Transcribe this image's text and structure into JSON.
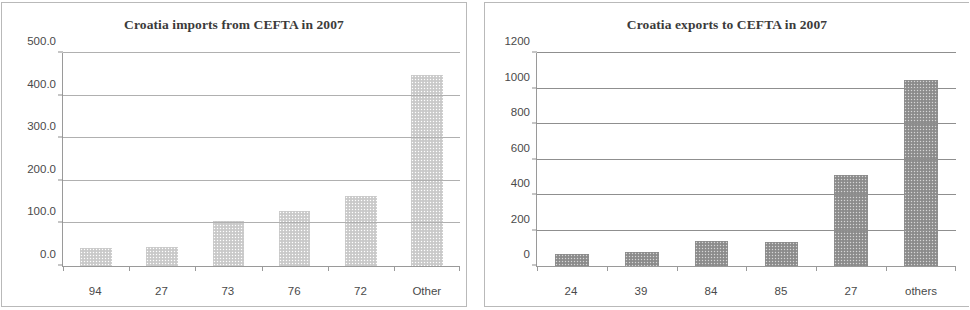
{
  "charts": [
    {
      "id": "imports",
      "title": "Croatia imports from CEFTA in 2007",
      "bar_color": "#cfcfcf",
      "chart_data": {
        "type": "bar",
        "title": "Croatia imports from CEFTA in 2007",
        "xlabel": "",
        "ylabel": "",
        "categories": [
          "94",
          "27",
          "73",
          "76",
          "72",
          "Other"
        ],
        "values": [
          43,
          45,
          105,
          130,
          165,
          448
        ],
        "ylim": [
          0,
          500
        ],
        "yticks": [
          0,
          100,
          200,
          300,
          400,
          500
        ],
        "ytick_labels": [
          "0.0",
          "100.0",
          "200.0",
          "300.0",
          "400.0",
          "500.0"
        ],
        "grid": true,
        "legend": null
      }
    },
    {
      "id": "exports",
      "title": "Croatia exports to CEFTA in 2007",
      "bar_color": "#949494",
      "chart_data": {
        "type": "bar",
        "title": "Croatia exports to CEFTA in 2007",
        "xlabel": "",
        "ylabel": "",
        "categories": [
          "24",
          "39",
          "84",
          "85",
          "27",
          "others"
        ],
        "values": [
          70,
          80,
          140,
          138,
          510,
          1050
        ],
        "ylim": [
          0,
          1200
        ],
        "yticks": [
          0,
          200,
          400,
          600,
          800,
          1000,
          1200
        ],
        "ytick_labels": [
          "0",
          "200",
          "400",
          "600",
          "800",
          "1000",
          "1200"
        ],
        "grid": true,
        "legend": null
      }
    }
  ]
}
